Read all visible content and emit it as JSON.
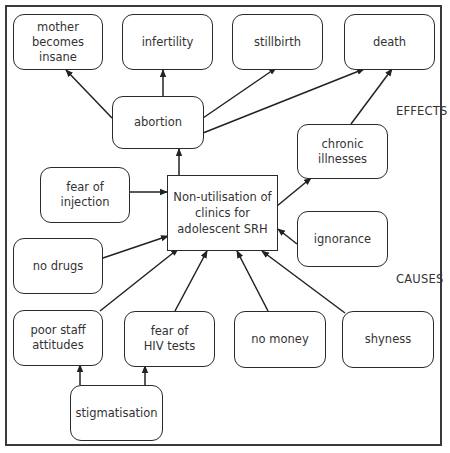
{
  "diagram": {
    "center": {
      "id": "center",
      "label": "Non-utilisation of\nclinics for\nadolescent SRH"
    },
    "section_labels": {
      "effects": "EFFECTS",
      "causes": "CAUSES"
    },
    "nodes": [
      {
        "id": "mother",
        "label": "mother\nbecomes\ninsane",
        "group": "effect"
      },
      {
        "id": "infertility",
        "label": "infertility",
        "group": "effect"
      },
      {
        "id": "stillbirth",
        "label": "stillbirth",
        "group": "effect"
      },
      {
        "id": "death",
        "label": "death",
        "group": "effect"
      },
      {
        "id": "abortion",
        "label": "abortion",
        "group": "effect"
      },
      {
        "id": "chronic",
        "label": "chronic\nillnesses",
        "group": "effect"
      },
      {
        "id": "fear_injection",
        "label": "fear of\ninjection",
        "group": "cause"
      },
      {
        "id": "ignorance",
        "label": "ignorance",
        "group": "cause"
      },
      {
        "id": "no_drugs",
        "label": "no drugs",
        "group": "cause"
      },
      {
        "id": "poor_staff",
        "label": "poor staff\nattitudes",
        "group": "cause"
      },
      {
        "id": "fear_hiv",
        "label": "fear of\nHIV tests",
        "group": "cause"
      },
      {
        "id": "no_money",
        "label": "no money",
        "group": "cause"
      },
      {
        "id": "shyness",
        "label": "shyness",
        "group": "cause"
      },
      {
        "id": "stigmatisation",
        "label": "stigmatisation",
        "group": "cause"
      }
    ],
    "edges": [
      {
        "from": "abortion",
        "to": "mother"
      },
      {
        "from": "abortion",
        "to": "infertility"
      },
      {
        "from": "abortion",
        "to": "stillbirth"
      },
      {
        "from": "abortion",
        "to": "death"
      },
      {
        "from": "chronic",
        "to": "death"
      },
      {
        "from": "center",
        "to": "abortion"
      },
      {
        "from": "center",
        "to": "chronic"
      },
      {
        "from": "fear_injection",
        "to": "center"
      },
      {
        "from": "ignorance",
        "to": "center"
      },
      {
        "from": "no_drugs",
        "to": "center"
      },
      {
        "from": "poor_staff",
        "to": "center"
      },
      {
        "from": "fear_hiv",
        "to": "center"
      },
      {
        "from": "no_money",
        "to": "center"
      },
      {
        "from": "shyness",
        "to": "center"
      },
      {
        "from": "stigmatisation",
        "to": "poor_staff"
      },
      {
        "from": "stigmatisation",
        "to": "fear_hiv"
      }
    ]
  }
}
